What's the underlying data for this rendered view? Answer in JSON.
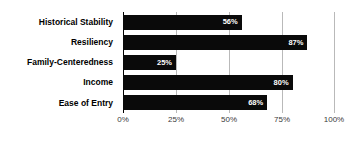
{
  "chart_data": {
    "type": "bar",
    "orientation": "horizontal",
    "title": "",
    "subtitle": "",
    "xlabel": "",
    "ylabel": "",
    "categories": [
      "Historical Stability",
      "Resiliency",
      "Family-Centeredness",
      "Income",
      "Ease of Entry"
    ],
    "values": [
      56,
      87,
      25,
      80,
      68
    ],
    "value_labels": [
      "56%",
      "87%",
      "25%",
      "80%",
      "68%"
    ],
    "xlim": [
      0,
      100
    ],
    "xticks": [
      0,
      25,
      50,
      75,
      100
    ],
    "xtick_labels": [
      "0%",
      "25%",
      "50%",
      "75%",
      "100%"
    ],
    "grid": true,
    "grid_axis": "x",
    "legend": false,
    "series": [
      {
        "name": "",
        "values": [
          56,
          87,
          25,
          80,
          68
        ]
      }
    ],
    "colors": {
      "bar": "#0a0a0a",
      "value_label": "#ffffff",
      "category_label": "#000000",
      "tick_label": "#3a3a3a",
      "gridline": "#b9b9b9",
      "axis": "#000000",
      "background": "#ffffff"
    }
  }
}
